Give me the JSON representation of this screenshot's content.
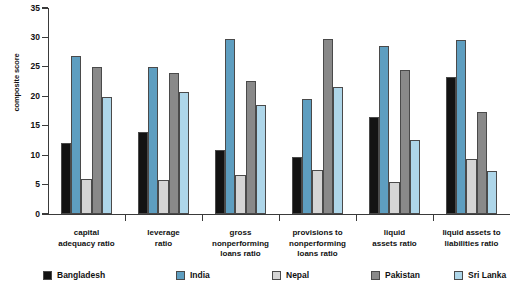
{
  "chart_data": {
    "type": "bar",
    "title": "",
    "xlabel": "",
    "ylabel": "composite score",
    "ylim": [
      0,
      35
    ],
    "yticks": [
      0,
      5,
      10,
      15,
      20,
      25,
      30,
      35
    ],
    "grid": false,
    "legend_position": "bottom",
    "categories": [
      "capital adequacy ratio",
      "leverage ratio",
      "gross nonperforming loans ratio",
      "provisions to nonperforming loans ratio",
      "liquid assets ratio",
      "liquid assets to liabilities ratio"
    ],
    "category_lines": [
      [
        "capital",
        "adequacy ratio"
      ],
      [
        "leverage",
        "ratio"
      ],
      [
        "gross",
        "nonperforming",
        "loans ratio"
      ],
      [
        "provisions to",
        "nonperforming",
        "loans ratio"
      ],
      [
        "liquid",
        "assets ratio"
      ],
      [
        "liquid assets to",
        "liabilities ratio"
      ]
    ],
    "series": [
      {
        "name": "Bangladesh",
        "color": "#131313",
        "values": [
          12.0,
          13.9,
          10.8,
          9.7,
          16.5,
          23.3
        ]
      },
      {
        "name": "India",
        "color": "#5e9ec0",
        "values": [
          26.9,
          24.9,
          29.8,
          19.6,
          28.5,
          29.5
        ]
      },
      {
        "name": "Nepal",
        "color": "#d5d5d5",
        "values": [
          5.9,
          5.8,
          6.6,
          7.5,
          5.5,
          9.4
        ]
      },
      {
        "name": "Pakistan",
        "color": "#898989",
        "values": [
          24.9,
          23.9,
          22.6,
          29.7,
          24.5,
          17.4
        ]
      },
      {
        "name": "Sri Lanka",
        "color": "#aed6e9",
        "values": [
          19.9,
          20.7,
          18.6,
          21.6,
          12.6,
          7.3
        ]
      }
    ]
  }
}
